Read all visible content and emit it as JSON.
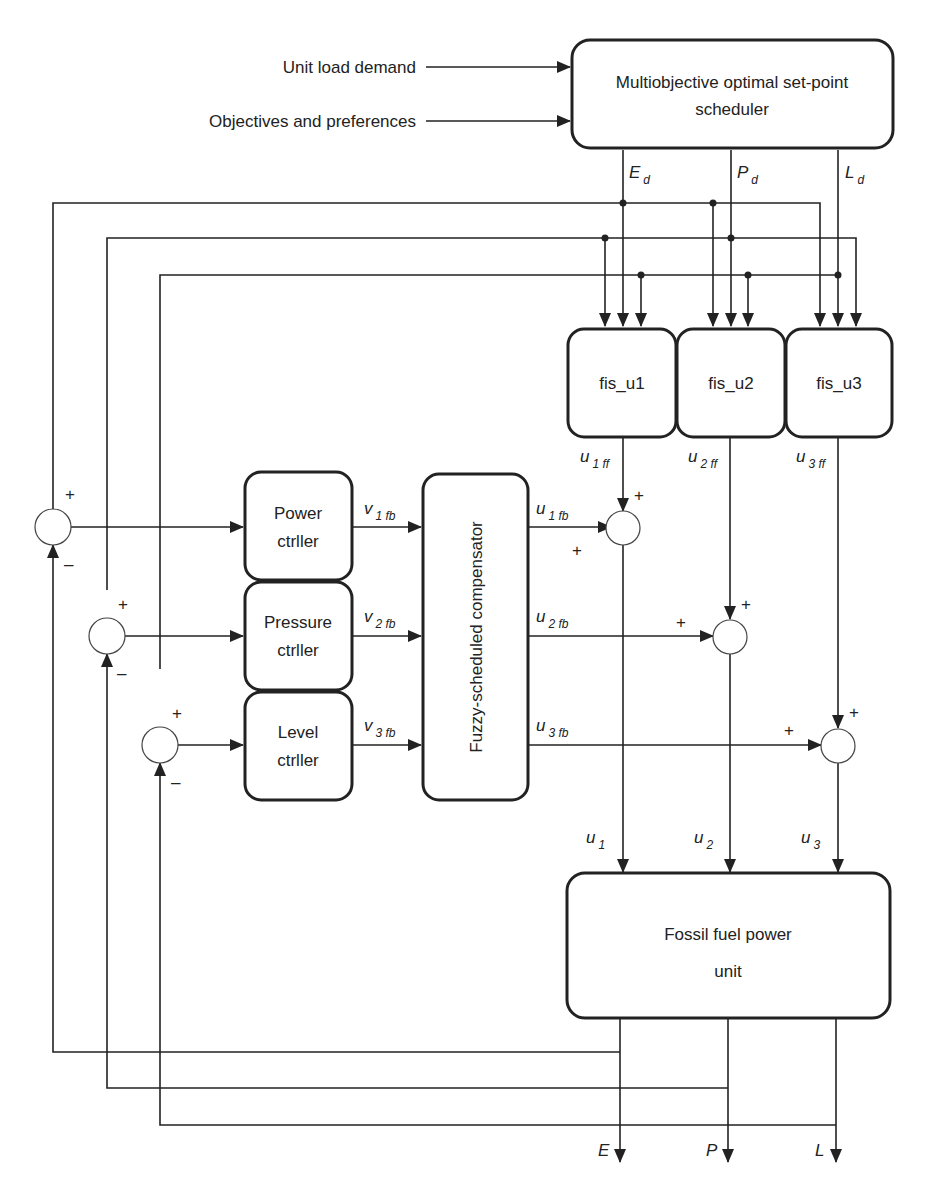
{
  "inputs": {
    "unit_load_demand": "Unit load demand",
    "objectives": "Objectives and preferences"
  },
  "blocks": {
    "scheduler": {
      "line1": "Multiobjective optimal set-point",
      "line2": "scheduler"
    },
    "fis": [
      "fis_u1",
      "fis_u2",
      "fis_u3"
    ],
    "controllers": [
      {
        "line1": "Power",
        "line2": "ctrller"
      },
      {
        "line1": "Pressure",
        "line2": "ctrller"
      },
      {
        "line1": "Level",
        "line2": "ctrller"
      }
    ],
    "compensator": "Fuzzy-scheduled compensator",
    "plant": {
      "line1": "Fossil fuel power",
      "line2": "unit"
    }
  },
  "signals": {
    "setpoints": [
      {
        "main": "E",
        "sub": "d"
      },
      {
        "main": "P",
        "sub": "d"
      },
      {
        "main": "L",
        "sub": "d"
      }
    ],
    "feedforward": [
      {
        "main": "u",
        "sub": "1 ff"
      },
      {
        "main": "u",
        "sub": "2 ff"
      },
      {
        "main": "u",
        "sub": "3 ff"
      }
    ],
    "controller_out": [
      {
        "main": "v",
        "sub": "1 fb"
      },
      {
        "main": "v",
        "sub": "2 fb"
      },
      {
        "main": "v",
        "sub": "3 fb"
      }
    ],
    "compensator_out": [
      {
        "main": "u",
        "sub": "1 fb"
      },
      {
        "main": "u",
        "sub": "2 fb"
      },
      {
        "main": "u",
        "sub": "3 fb"
      }
    ],
    "plant_in": [
      {
        "main": "u",
        "sub": "1"
      },
      {
        "main": "u",
        "sub": "2"
      },
      {
        "main": "u",
        "sub": "3"
      }
    ],
    "outputs": [
      "E",
      "P",
      "L"
    ]
  },
  "summer_signs": {
    "plus": "+",
    "minus": "–"
  }
}
